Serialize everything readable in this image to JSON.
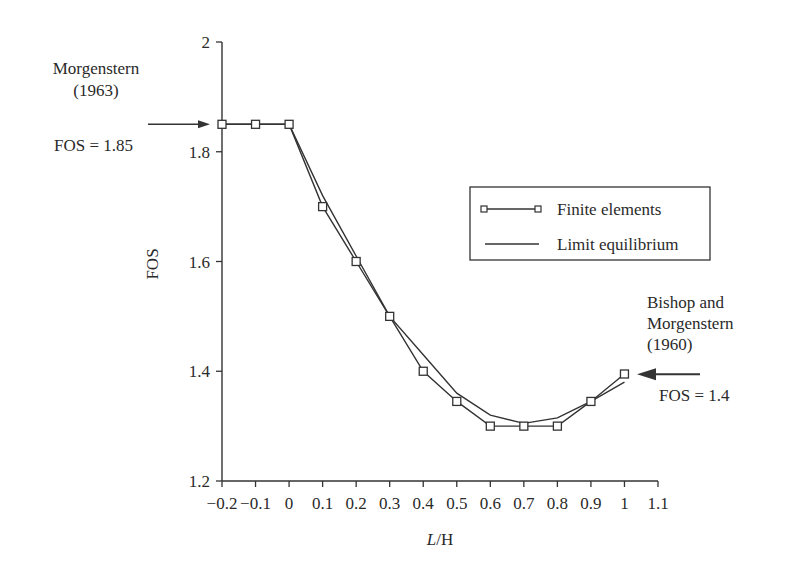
{
  "chart_data": {
    "type": "line",
    "title": "",
    "xlabel_italic": "L",
    "xlabel_rest": "/H",
    "xlabel": "L/H",
    "ylabel": "FOS",
    "xlim": [
      -0.2,
      1.1
    ],
    "ylim": [
      1.2,
      2.0
    ],
    "grid": false,
    "legend_position": "upper right (inside)",
    "x_ticks": [
      -0.2,
      -0.1,
      0,
      0.1,
      0.2,
      0.3,
      0.4,
      0.5,
      0.6,
      0.7,
      0.8,
      0.9,
      1,
      1.1
    ],
    "x_tick_labels": [
      "−0.2",
      "−0.1",
      "0",
      "0.1",
      "0.2",
      "0.3",
      "0.4",
      "0.5",
      "0.6",
      "0.7",
      "0.8",
      "0.9",
      "1",
      "1.1"
    ],
    "y_ticks": [
      1.2,
      1.4,
      1.6,
      1.8,
      2.0
    ],
    "y_tick_labels": [
      "1.2",
      "1.4",
      "1.6",
      "1.8",
      "2"
    ],
    "x": [
      -0.2,
      -0.1,
      0,
      0.1,
      0.2,
      0.3,
      0.4,
      0.5,
      0.6,
      0.7,
      0.8,
      0.9,
      1.0
    ],
    "series": [
      {
        "name": "Finite elements",
        "marker": "square",
        "values": [
          1.85,
          1.85,
          1.85,
          1.7,
          1.6,
          1.5,
          1.4,
          1.345,
          1.3,
          1.3,
          1.3,
          1.345,
          1.395
        ]
      },
      {
        "name": "Limit equilibrium",
        "marker": "none",
        "values": [
          1.85,
          1.85,
          1.85,
          1.72,
          1.61,
          1.5,
          1.43,
          1.36,
          1.32,
          1.305,
          1.315,
          1.345,
          1.38
        ]
      }
    ],
    "annotations": [
      {
        "lines": [
          "Morgenstern",
          "(1963)"
        ],
        "value_text": "FOS = 1.85",
        "points_to": {
          "x": -0.2,
          "y": 1.85
        },
        "arrow_direction": "right"
      },
      {
        "lines": [
          "Bishop and",
          "Morgenstern",
          "(1960)"
        ],
        "value_text": "FOS = 1.4",
        "points_to": {
          "x": 1.0,
          "y": 1.4
        },
        "arrow_direction": "left"
      }
    ]
  },
  "annotations": {
    "left": {
      "line1": "Morgenstern",
      "line2": "(1963)",
      "value": "FOS = 1.85"
    },
    "right": {
      "line1": "Bishop and",
      "line2": "Morgenstern",
      "line3": "(1960)",
      "value": "FOS = 1.4"
    }
  },
  "legend": {
    "items": [
      {
        "label": "Finite elements"
      },
      {
        "label": "Limit equilibrium"
      }
    ]
  },
  "colors": {
    "line": "#333333",
    "text": "#2a2a2a",
    "background": "#ffffff"
  }
}
